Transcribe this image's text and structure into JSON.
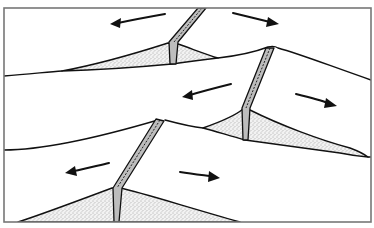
{
  "figure": {
    "colors": {
      "line": "#111111",
      "frame": "#777777",
      "dike_fill": "#bdbdbd",
      "stipple": "#555555",
      "background": "#ffffff"
    },
    "ridges": [
      {
        "id": "upper",
        "label": ""
      },
      {
        "id": "middle",
        "label": ""
      },
      {
        "id": "lower",
        "label": ""
      }
    ],
    "arrows": [
      {
        "id": "arrow-upper-left",
        "direction": "left"
      },
      {
        "id": "arrow-upper-right",
        "direction": "right"
      },
      {
        "id": "arrow-middle-left",
        "direction": "left"
      },
      {
        "id": "arrow-middle-right",
        "direction": "right"
      },
      {
        "id": "arrow-lower-left",
        "direction": "left"
      },
      {
        "id": "arrow-lower-right",
        "direction": "right"
      }
    ]
  }
}
